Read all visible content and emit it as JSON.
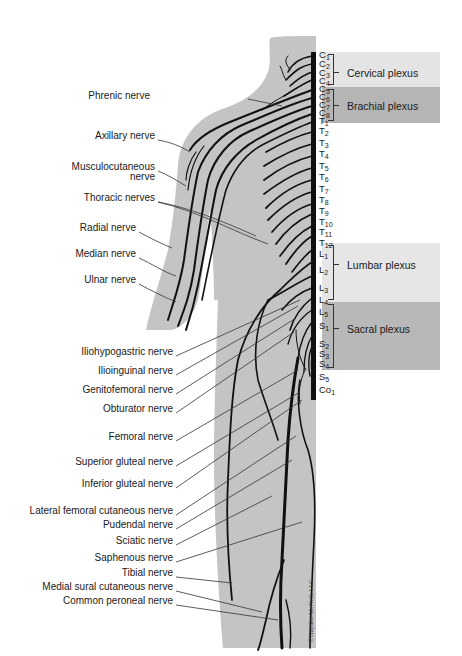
{
  "diagram": {
    "colors": {
      "body_fill": "#c4c4c4",
      "nerve": "#111111",
      "cervical_band": "#e4e4e4",
      "brachial_band": "#b5b5b5",
      "lumbar_band": "#e6e6e6",
      "sacral_band": "#b8b8b8",
      "text": "#1a1a1a"
    },
    "spinal_segments": [
      {
        "id": "C1",
        "letter": "C",
        "num": "1",
        "y": 55
      },
      {
        "id": "C2",
        "letter": "C",
        "num": "2",
        "y": 64
      },
      {
        "id": "C3",
        "letter": "C",
        "num": "3",
        "y": 73
      },
      {
        "id": "C4",
        "letter": "C",
        "num": "4",
        "y": 81
      },
      {
        "id": "C5",
        "letter": "C",
        "num": "5",
        "y": 89
      },
      {
        "id": "C6",
        "letter": "C",
        "num": "6",
        "y": 97
      },
      {
        "id": "C7",
        "letter": "C",
        "num": "7",
        "y": 105
      },
      {
        "id": "C8",
        "letter": "C",
        "num": "8",
        "y": 113
      },
      {
        "id": "T1",
        "letter": "T",
        "num": "1",
        "y": 121
      },
      {
        "id": "T2",
        "letter": "T",
        "num": "2",
        "y": 131
      },
      {
        "id": "T3",
        "letter": "T",
        "num": "3",
        "y": 143
      },
      {
        "id": "T4",
        "letter": "T",
        "num": "4",
        "y": 154
      },
      {
        "id": "T5",
        "letter": "T",
        "num": "5",
        "y": 166
      },
      {
        "id": "T6",
        "letter": "T",
        "num": "6",
        "y": 177
      },
      {
        "id": "T7",
        "letter": "T",
        "num": "7",
        "y": 189
      },
      {
        "id": "T8",
        "letter": "T",
        "num": "8",
        "y": 200
      },
      {
        "id": "T9",
        "letter": "T",
        "num": "9",
        "y": 211
      },
      {
        "id": "T10",
        "letter": "T",
        "num": "10",
        "y": 222
      },
      {
        "id": "T11",
        "letter": "T",
        "num": "11",
        "y": 232
      },
      {
        "id": "T12",
        "letter": "T",
        "num": "12",
        "y": 243
      },
      {
        "id": "L1",
        "letter": "L",
        "num": "1",
        "y": 254
      },
      {
        "id": "L2",
        "letter": "L",
        "num": "2",
        "y": 270
      },
      {
        "id": "L3",
        "letter": "L",
        "num": "3",
        "y": 288
      },
      {
        "id": "L4",
        "letter": "L",
        "num": "4",
        "y": 300
      },
      {
        "id": "L5",
        "letter": "L",
        "num": "5",
        "y": 312
      },
      {
        "id": "S1",
        "letter": "S",
        "num": "1",
        "y": 326
      },
      {
        "id": "S2",
        "letter": "S",
        "num": "2",
        "y": 344
      },
      {
        "id": "S3",
        "letter": "S",
        "num": "3",
        "y": 354
      },
      {
        "id": "S4",
        "letter": "S",
        "num": "4",
        "y": 364
      },
      {
        "id": "S5",
        "letter": "S",
        "num": "5",
        "y": 377
      },
      {
        "id": "Co1",
        "letter": "Co",
        "num": "1",
        "y": 390
      }
    ],
    "plexuses": [
      {
        "name": "Cervical plexus",
        "from": "C1",
        "to": "C4",
        "top": 52,
        "height": 35,
        "color": "#e4e4e4",
        "label_y": 67
      },
      {
        "name": "Brachial plexus",
        "from": "C5",
        "to": "T1",
        "top": 87,
        "height": 36,
        "color": "#b5b5b5",
        "label_y": 100
      },
      {
        "name": "Lumbar plexus",
        "from": "T12",
        "to": "L4",
        "top": 243,
        "height": 59,
        "color": "#e6e6e6",
        "label_y": 259
      },
      {
        "name": "Sacral plexus",
        "from": "L4",
        "to": "S4",
        "top": 302,
        "height": 68,
        "color": "#b8b8b8",
        "label_y": 323
      }
    ],
    "nerve_labels": [
      {
        "name": "Phrenic nerve",
        "x": 150,
        "y": 96,
        "lines": [
          "Phrenic nerve"
        ]
      },
      {
        "name": "Axillary nerve",
        "x": 155,
        "y": 136,
        "lines": [
          "Axillary nerve"
        ]
      },
      {
        "name": "Musculocutaneous nerve",
        "x": 155,
        "y": 167,
        "lines": [
          "Musculocutaneous",
          "nerve"
        ]
      },
      {
        "name": "Thoracic nerves",
        "x": 155,
        "y": 198,
        "lines": [
          "Thoracic nerves"
        ]
      },
      {
        "name": "Radial nerve",
        "x": 136,
        "y": 228,
        "lines": [
          "Radial nerve"
        ]
      },
      {
        "name": "Median nerve",
        "x": 136,
        "y": 254,
        "lines": [
          "Median nerve"
        ]
      },
      {
        "name": "Ulnar nerve",
        "x": 136,
        "y": 280,
        "lines": [
          "Ulnar nerve"
        ]
      },
      {
        "name": "Iliohypogastric nerve",
        "x": 173,
        "y": 352,
        "lines": [
          "Iliohypogastric nerve"
        ]
      },
      {
        "name": "Ilioinguinal nerve",
        "x": 173,
        "y": 371,
        "lines": [
          "Ilioinguinal nerve"
        ]
      },
      {
        "name": "Genitofemoral nerve",
        "x": 173,
        "y": 390,
        "lines": [
          "Genitofemoral nerve"
        ]
      },
      {
        "name": "Obturator nerve",
        "x": 173,
        "y": 409,
        "lines": [
          "Obturator nerve"
        ]
      },
      {
        "name": "Femoral nerve",
        "x": 173,
        "y": 437,
        "lines": [
          "Femoral nerve"
        ]
      },
      {
        "name": "Superior gluteal nerve",
        "x": 173,
        "y": 462,
        "lines": [
          "Superior gluteal nerve"
        ]
      },
      {
        "name": "Inferior gluteal nerve",
        "x": 173,
        "y": 484,
        "lines": [
          "Inferior gluteal nerve"
        ]
      },
      {
        "name": "Lateral femoral cutaneous nerve",
        "x": 173,
        "y": 511,
        "lines": [
          "Lateral femoral cutaneous nerve"
        ]
      },
      {
        "name": "Pudendal nerve",
        "x": 173,
        "y": 525,
        "lines": [
          "Pudendal nerve"
        ]
      },
      {
        "name": "Sciatic nerve",
        "x": 173,
        "y": 541,
        "lines": [
          "Sciatic nerve"
        ]
      },
      {
        "name": "Saphenous nerve",
        "x": 173,
        "y": 558,
        "lines": [
          "Saphenous nerve"
        ]
      },
      {
        "name": "Tibial nerve",
        "x": 173,
        "y": 573,
        "lines": [
          "Tibial nerve"
        ]
      },
      {
        "name": "Medial sural cutaneous nerve",
        "x": 173,
        "y": 587,
        "lines": [
          "Medial sural cutaneous nerve"
        ]
      },
      {
        "name": "Common peroneal nerve",
        "x": 173,
        "y": 601,
        "lines": [
          "Common peroneal nerve"
        ]
      }
    ],
    "credit": "©Hayden-McNeil, LLC"
  }
}
